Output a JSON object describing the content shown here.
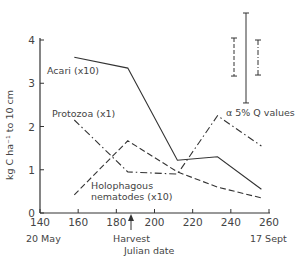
{
  "chart_data": {
    "type": "line",
    "title": "",
    "xlabel": "Julian date",
    "ylabel": "kg C ha⁻¹ to 10 cm",
    "xlim": [
      140,
      260
    ],
    "ylim": [
      0,
      4
    ],
    "x_ticks": [
      140,
      160,
      180,
      200,
      220,
      240,
      260
    ],
    "y_ticks": [
      0,
      1,
      2,
      3,
      4
    ],
    "x_tick_labels": [
      "140",
      "160",
      "180",
      "200",
      "220",
      "240",
      "260"
    ],
    "y_tick_labels": [
      "0",
      "1",
      "2",
      "3",
      "4"
    ],
    "x_sublabels": {
      "start": "20 May",
      "end": "17 Sept"
    },
    "annotations": [
      {
        "text": "Harvest",
        "x": 188,
        "type": "arrow"
      },
      {
        "text": "α 5% Q values",
        "type": "error-bar-legend"
      }
    ],
    "grid": false,
    "legend": "inline labels",
    "series": [
      {
        "name": "Acari (x10)",
        "style": "solid",
        "x": [
          158,
          186,
          212,
          233,
          256
        ],
        "values": [
          3.6,
          3.35,
          1.22,
          1.3,
          0.55
        ]
      },
      {
        "name": "Protozoa (x1)",
        "style": "dash-dot",
        "x": [
          158,
          186,
          212,
          233,
          256
        ],
        "values": [
          2.15,
          0.95,
          0.9,
          2.25,
          1.55
        ]
      },
      {
        "name": "Holophagous nematodes (x10)",
        "style": "dashed",
        "x": [
          158,
          186,
          212,
          233,
          256
        ],
        "values": [
          0.42,
          1.67,
          0.95,
          0.6,
          0.35
        ]
      }
    ],
    "error_bars": [
      {
        "series": "Holophagous nematodes (x10)",
        "style": "dashed",
        "length": 0.88
      },
      {
        "series": "Acari (x10)",
        "style": "solid",
        "length": 2.08
      },
      {
        "series": "Protozoa (x1)",
        "style": "dash-dot",
        "length": 0.81
      }
    ]
  },
  "labels": {
    "acari": "Acari (x10)",
    "protozoa": "Protozoa (x1)",
    "nematodes_line1": "Holophagous",
    "nematodes_line2": "nematodes (x10)",
    "q_values": "α 5%  Q  values",
    "harvest": "Harvest",
    "xlabel": "Julian date",
    "ylabel": "kg C ha⁻¹ to 10 cm",
    "start_date": "20 May",
    "end_date": "17 Sept"
  }
}
